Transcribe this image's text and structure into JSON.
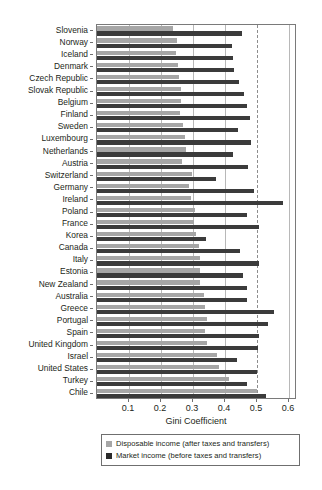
{
  "chart_data": {
    "type": "bar",
    "orientation": "horizontal",
    "title": "",
    "xlabel": "Gini Coefficient",
    "ylabel": "",
    "xlim": [
      0,
      0.625
    ],
    "xticks": [
      0.1,
      0.2,
      0.3,
      0.4,
      0.5,
      0.6
    ],
    "xtick_labels": [
      "0.1",
      "0.2",
      "0.3",
      "0.4",
      "0.5",
      "0.6"
    ],
    "grid": "vertical gridlines at each 0.1 tick; dashed gridline at 0.5",
    "legend_position": "below axis, bordered box",
    "categories": [
      "Slovenia",
      "Norway",
      "Iceland",
      "Denmark",
      "Czech Republic",
      "Slovak Republic",
      "Belgium",
      "Finland",
      "Sweden",
      "Luxembourg",
      "Netherlands",
      "Austria",
      "Switzerland",
      "Germany",
      "Ireland",
      "Poland",
      "France",
      "Korea",
      "Canada",
      "Italy",
      "Estonia",
      "New Zealand",
      "Australia",
      "Greece",
      "Portugal",
      "Spain",
      "United Kingdom",
      "Israel",
      "United States",
      "Turkey",
      "Chile"
    ],
    "series": [
      {
        "name": "Disposable income (after taxes and transfers)",
        "color": "#a6a6a6",
        "values": [
          0.236,
          0.249,
          0.246,
          0.252,
          0.256,
          0.261,
          0.262,
          0.26,
          0.269,
          0.276,
          0.278,
          0.267,
          0.298,
          0.286,
          0.293,
          0.305,
          0.303,
          0.31,
          0.32,
          0.321,
          0.323,
          0.323,
          0.334,
          0.337,
          0.344,
          0.338,
          0.345,
          0.376,
          0.38,
          0.411,
          0.501
        ]
      },
      {
        "name": "Market income (before taxes and transfers)",
        "color": "#3b3b3b",
        "values": [
          0.452,
          0.423,
          0.425,
          0.429,
          0.444,
          0.458,
          0.469,
          0.479,
          0.441,
          0.482,
          0.426,
          0.472,
          0.372,
          0.492,
          0.58,
          0.47,
          0.505,
          0.341,
          0.447,
          0.505,
          0.457,
          0.468,
          0.469,
          0.552,
          0.535,
          0.507,
          0.502,
          0.436,
          0.499,
          0.47,
          0.527
        ]
      }
    ]
  },
  "axis": {
    "x_title": "Gini Coefficient"
  },
  "legend": {
    "items": [
      {
        "label": "Disposable income (after taxes and transfers)",
        "swatch": "light"
      },
      {
        "label": "Market income (before taxes and transfers)",
        "swatch": "dark"
      }
    ]
  },
  "colors": {
    "disposable": "#a6a6a6",
    "market": "#3b3b3b",
    "axis": "#7a7a7a",
    "gridline": "#b8b8b8",
    "dashed_gridline": "#8d8d8d",
    "text": "#231f20",
    "background": "#ffffff"
  }
}
